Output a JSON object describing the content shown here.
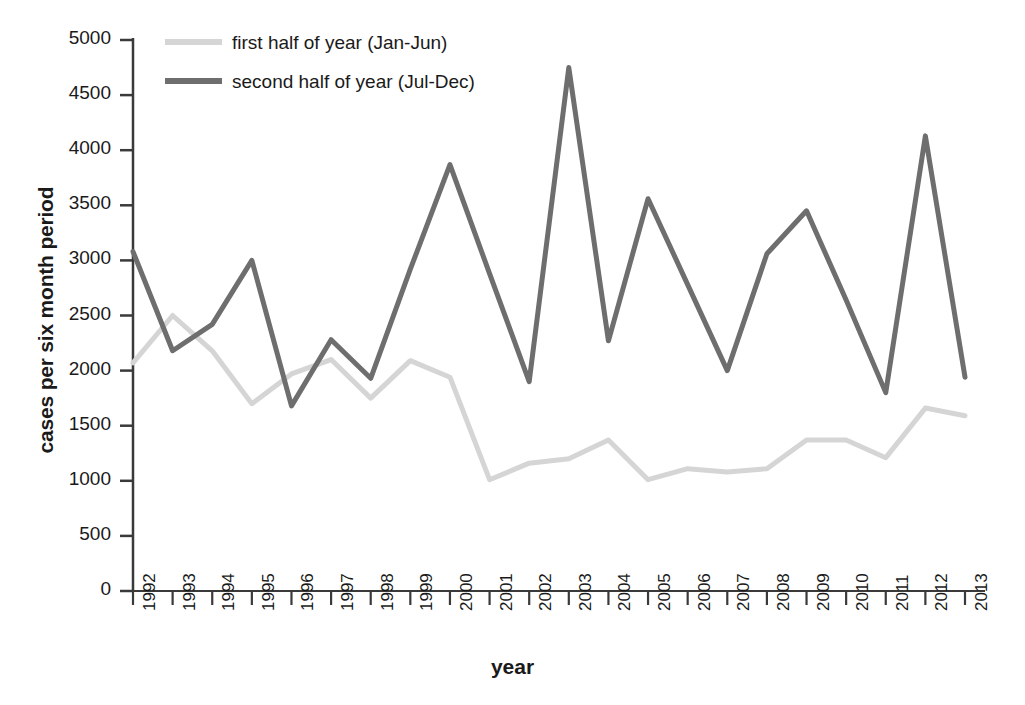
{
  "chart_data": {
    "type": "line",
    "title": "",
    "xlabel": "year",
    "ylabel": "cases per six month period",
    "categories": [
      "1992",
      "1993",
      "1994",
      "1995",
      "1996",
      "1997",
      "1998",
      "1999",
      "2000",
      "2001",
      "2002",
      "2003",
      "2004",
      "2005",
      "2006",
      "2007",
      "2008",
      "2009",
      "2010",
      "2011",
      "2012",
      "2013"
    ],
    "xlim": [
      1992,
      2013
    ],
    "ylim": [
      0,
      5000
    ],
    "ytick_labels": [
      "0",
      "500",
      "1000",
      "1500",
      "2000",
      "2500",
      "3000",
      "3500",
      "4000",
      "4500",
      "5000"
    ],
    "ytick_values": [
      0,
      500,
      1000,
      1500,
      2000,
      2500,
      3000,
      3500,
      4000,
      4500,
      5000
    ],
    "grid": false,
    "legend_position": "top-left",
    "series": [
      {
        "name": "first half of year (Jan-Jun)",
        "color": "#d5d5d5",
        "values": [
          2070,
          2500,
          2180,
          1700,
          1970,
          2100,
          1750,
          2090,
          1940,
          1010,
          1160,
          1200,
          1370,
          1010,
          1110,
          1080,
          1110,
          1370,
          1370,
          1210,
          1660,
          1590
        ]
      },
      {
        "name": "second half of year (Jul-Dec)",
        "color": "#6e6e6e",
        "values": [
          3080,
          2180,
          2420,
          3000,
          1680,
          2280,
          1930,
          2920,
          3870,
          2880,
          1900,
          4750,
          2270,
          3560,
          2780,
          2000,
          3060,
          3450,
          2640,
          1800,
          4130,
          1940
        ]
      }
    ]
  },
  "legend": {
    "items": [
      {
        "label": "first half of year (Jan-Jun)",
        "color": "#d5d5d5"
      },
      {
        "label": "second half of year (Jul-Dec)",
        "color": "#6e6e6e"
      }
    ]
  }
}
